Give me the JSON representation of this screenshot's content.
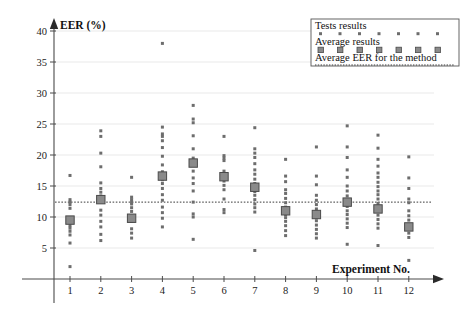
{
  "chart_data": {
    "type": "scatter",
    "title": "",
    "xlabel": "Experiment No.",
    "ylabel": "EER (%)",
    "xlim": [
      0.3,
      12.9
    ],
    "ylim": [
      0,
      41
    ],
    "yticks": [
      5,
      10,
      15,
      20,
      25,
      30,
      35,
      40
    ],
    "xticks": [
      1,
      2,
      3,
      4,
      5,
      6,
      7,
      8,
      9,
      10,
      11,
      12
    ],
    "grid": true,
    "grid_axis": "y",
    "legend_position": "top-right",
    "overall_average_eer": 12.4,
    "series": [
      {
        "name": "Tests results",
        "marker": "dot",
        "color": "#6d6d6d",
        "points": [
          {
            "x": 1,
            "values": [
              16.7,
              12.8,
              12.4,
              12.0,
              11.4,
              9.5,
              8.6,
              8.2,
              7.7,
              7.1,
              5.8,
              2.0
            ]
          },
          {
            "x": 2,
            "values": [
              23.9,
              23.0,
              20.3,
              18.1,
              15.5,
              14.6,
              14.0,
              13.4,
              12.9,
              12.6,
              11.1,
              10.3,
              9.3,
              8.4,
              7.2,
              6.2
            ]
          },
          {
            "x": 3,
            "values": [
              16.4,
              13.2,
              12.8,
              12.4,
              12.1,
              11.5,
              10.9,
              10.2,
              9.8,
              9.3,
              8.1,
              7.4,
              6.6
            ]
          },
          {
            "x": 4,
            "values": [
              38.0,
              24.5,
              23.4,
              23.0,
              22.3,
              21.2,
              19.8,
              18.4,
              17.3,
              16.6,
              16.0,
              15.4,
              14.6,
              13.6,
              12.7,
              11.6,
              10.7,
              9.8,
              8.4
            ]
          },
          {
            "x": 5,
            "values": [
              28.0,
              25.8,
              25.2,
              23.1,
              21.0,
              19.5,
              18.7,
              17.4,
              16.3,
              15.4,
              14.2,
              12.4,
              10.5,
              10.0,
              6.4
            ]
          },
          {
            "x": 6,
            "values": [
              23.0,
              19.9,
              19.5,
              19.1,
              17.4,
              16.8,
              16.4,
              15.8,
              15.1,
              14.4,
              12.9,
              11.2,
              10.7
            ]
          },
          {
            "x": 7,
            "values": [
              24.4,
              21.0,
              20.3,
              19.6,
              18.6,
              17.6,
              16.9,
              16.1,
              15.4,
              14.8,
              14.1,
              13.5,
              12.8,
              12.1,
              11.5,
              10.8,
              4.6
            ]
          },
          {
            "x": 8,
            "values": [
              19.3,
              16.6,
              15.7,
              14.4,
              13.8,
              13.0,
              12.3,
              11.6,
              11.0,
              10.4,
              9.9,
              9.3,
              8.6,
              7.8,
              7.0
            ]
          },
          {
            "x": 9,
            "values": [
              21.3,
              16.6,
              15.2,
              13.5,
              12.7,
              12.0,
              11.3,
              10.6,
              10.0,
              9.4,
              8.7,
              8.0,
              7.3,
              6.6
            ]
          },
          {
            "x": 10,
            "values": [
              24.7,
              21.3,
              19.6,
              17.6,
              16.4,
              15.0,
              14.2,
              13.4,
              12.8,
              12.3,
              11.7,
              11.0,
              10.4,
              9.7,
              9.0,
              8.3,
              5.6
            ]
          },
          {
            "x": 11,
            "values": [
              23.2,
              21.1,
              19.3,
              18.2,
              17.1,
              16.4,
              15.6,
              14.9,
              14.2,
              13.6,
              12.9,
              12.2,
              11.6,
              11.0,
              10.3,
              9.6,
              8.9,
              8.2,
              5.4
            ]
          },
          {
            "x": 12,
            "values": [
              19.7,
              16.3,
              14.6,
              12.9,
              12.3,
              11.0,
              10.2,
              9.5,
              8.8,
              8.1,
              7.4,
              6.7,
              3.0
            ]
          }
        ]
      },
      {
        "name": "Average results",
        "marker": "square",
        "color": "#8a8a8a",
        "x": [
          1,
          2,
          3,
          4,
          5,
          6,
          7,
          8,
          9,
          10,
          11,
          12
        ],
        "values": [
          9.5,
          12.8,
          9.8,
          16.6,
          18.7,
          16.5,
          14.8,
          11.0,
          10.4,
          12.4,
          11.3,
          8.4
        ]
      },
      {
        "name": "Average EER for the method",
        "marker": "dashed-line",
        "color": "#3a3a3a",
        "value": 12.4
      }
    ]
  },
  "legend": {
    "entries": [
      {
        "label": "Tests results",
        "marker": "dot",
        "sample_count": 7
      },
      {
        "label": "Average results",
        "marker": "square",
        "sample_count": 7
      },
      {
        "label": "Average EER for the method",
        "marker": "dashed-line",
        "sample_count": 1
      }
    ]
  },
  "axes": {
    "y_title": "EER (%)",
    "x_title": "Experiment No.",
    "y_tick_labels": [
      "5",
      "10",
      "15",
      "20",
      "25",
      "30",
      "35",
      "40"
    ],
    "x_tick_labels": [
      "1",
      "2",
      "3",
      "4",
      "5",
      "6",
      "7",
      "8",
      "9",
      "10",
      "11",
      "12"
    ]
  }
}
